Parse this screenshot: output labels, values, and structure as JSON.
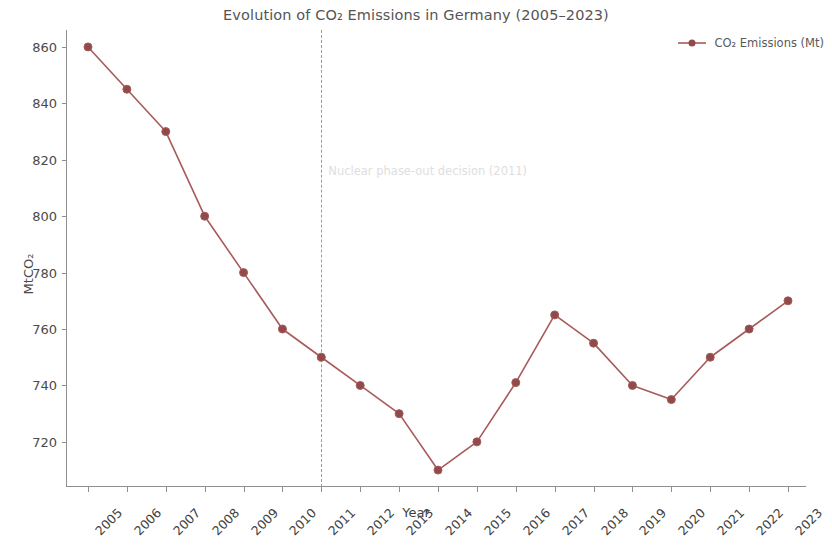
{
  "chart_data": {
    "type": "line",
    "title": "Evolution of CO₂ Emissions in Germany (2005–2023)",
    "xlabel": "Year",
    "ylabel": "MtCO₂",
    "categories": [
      "2005",
      "2006",
      "2007",
      "2008",
      "2009",
      "2010",
      "2011",
      "2012",
      "2013",
      "2014",
      "2015",
      "2016",
      "2017",
      "2018",
      "2019",
      "2020",
      "2021",
      "2022",
      "2023"
    ],
    "values": [
      860,
      845,
      830,
      800,
      780,
      760,
      750,
      740,
      730,
      710,
      720,
      741,
      765,
      755,
      740,
      735,
      750,
      760,
      770
    ],
    "series": [
      {
        "name": "CO₂ Emissions (Mt)",
        "color": "#a85a5a",
        "marker": "circle",
        "values": [
          860,
          845,
          830,
          800,
          780,
          760,
          750,
          740,
          730,
          710,
          720,
          741,
          765,
          755,
          740,
          735,
          750,
          760,
          770
        ]
      }
    ],
    "xlim": [
      2004.3,
      2023.7
    ],
    "ylim": [
      704,
      866
    ],
    "yticks": [
      720,
      740,
      760,
      780,
      800,
      820,
      840,
      860
    ],
    "ytick_labels": [
      "720",
      "740",
      "760",
      "780",
      "800",
      "820",
      "840",
      "860"
    ],
    "xticks": [
      "2005",
      "2006",
      "2007",
      "2008",
      "2009",
      "2010",
      "2011",
      "2012",
      "2013",
      "2014",
      "2015",
      "2016",
      "2017",
      "2018",
      "2019",
      "2020",
      "2021",
      "2022",
      "2023"
    ],
    "grid": false,
    "legend_position": "top-right",
    "annotations": [
      {
        "text": "Nuclear phase-out decision (2011)",
        "x": "2011",
        "type": "vline-label",
        "line_style": "dashed",
        "line_color": "#9a9a9a",
        "text_color": "#dedede",
        "y_value": 816
      }
    ]
  },
  "legend": {
    "entries": [
      {
        "label": "CO₂ Emissions (Mt)",
        "color": "#a85a5a"
      }
    ]
  }
}
